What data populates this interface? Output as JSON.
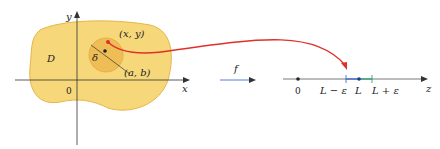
{
  "diagram": {
    "domain_label": "D",
    "origin_label": "0",
    "x_axis_label": "x",
    "y_axis_label": "y",
    "point_xy_label": "(x, y)",
    "point_ab_label": "(a, b)",
    "delta_label": "δ",
    "map_label": "f",
    "z_axis_label": "z",
    "z_origin_label": "0",
    "l_minus_label": "L − ε",
    "l_label": "L",
    "l_plus_label": "L + ε"
  },
  "colors": {
    "region_fill": "#f6d77a",
    "region_stroke": "#e7b64a",
    "disk_fill": "#efbd55",
    "curve": "#e0302a",
    "interval": "#2a5bd7",
    "interval_plus": "#1f9a6a",
    "axis": "#333333"
  }
}
